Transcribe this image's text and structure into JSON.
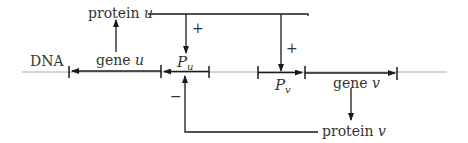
{
  "diagram": {
    "dna_label": "DNA",
    "gene_u": {
      "label": "gene ",
      "var": "u"
    },
    "gene_v": {
      "label": "gene ",
      "var": "v"
    },
    "promoter_u": {
      "label": "P",
      "sub": "u"
    },
    "promoter_v": {
      "label": "P",
      "sub": "v"
    },
    "protein_u": {
      "label": "protein ",
      "var": "u"
    },
    "protein_v": {
      "label": "protein ",
      "var": "v"
    },
    "regulation": {
      "u_to_Pu": "+",
      "u_to_Pv": "+",
      "v_to_Pu": "−"
    },
    "colors": {
      "line": "#1a1a1a",
      "dna": "#aaaaaa",
      "text": "#333333"
    }
  }
}
